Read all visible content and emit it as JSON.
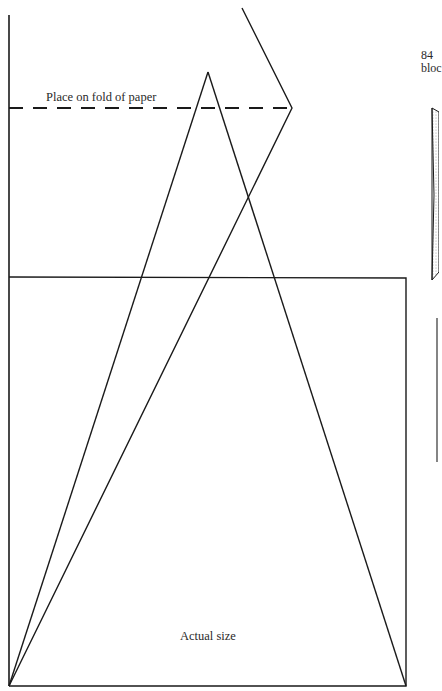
{
  "diagram": {
    "fold_label": "Place on fold of paper",
    "size_label": "Actual size",
    "page_number": "84",
    "page_text_fragment": "bloc",
    "colors": {
      "line": "#1a1a1a",
      "background": "#ffffff",
      "stipple": "#888888"
    }
  }
}
